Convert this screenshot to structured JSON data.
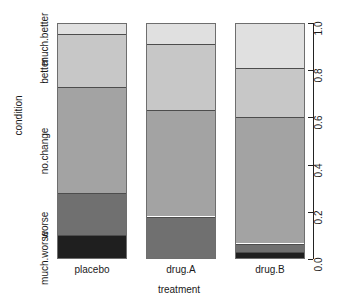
{
  "chart_data": {
    "type": "bar",
    "variant": "stacked-proportional-mosaic",
    "title": "",
    "xlabel": "treatment",
    "ylabel": "condition",
    "categories": [
      "placebo",
      "drug.A",
      "drug.B"
    ],
    "stack_levels": [
      "much.worse",
      "worse",
      "no.change",
      "better",
      "much.better"
    ],
    "right_axis": {
      "ticks": [
        "0.0",
        "0.2",
        "0.4",
        "0.6",
        "0.8",
        "1.0"
      ],
      "tick_values": [
        0.0,
        0.2,
        0.4,
        0.6,
        0.8,
        1.0
      ],
      "limits": [
        0.0,
        1.0
      ]
    },
    "grid": false,
    "legend": "none",
    "series": [
      {
        "name": "much.worse",
        "values": [
          0.1,
          0.0,
          0.03
        ],
        "color": "#1f1f1f"
      },
      {
        "name": "worse",
        "values": [
          0.18,
          0.18,
          0.035
        ],
        "color": "#707070"
      },
      {
        "name": "no.change",
        "values": [
          0.45,
          0.45,
          0.535
        ],
        "color": "#a3a3a3"
      },
      {
        "name": "better",
        "values": [
          0.225,
          0.28,
          0.21
        ],
        "color": "#c7c7c7"
      },
      {
        "name": "much.better",
        "values": [
          0.045,
          0.09,
          0.19
        ],
        "color": "#e0e0e0"
      }
    ],
    "columns": [
      {
        "category": "placebo",
        "segments": [
          {
            "level": "much.better",
            "value": 0.045,
            "color": "#e0e0e0"
          },
          {
            "level": "better",
            "value": 0.225,
            "color": "#c7c7c7"
          },
          {
            "level": "no.change",
            "value": 0.45,
            "color": "#a3a3a3"
          },
          {
            "level": "worse",
            "value": 0.18,
            "color": "#707070"
          },
          {
            "level": "much.worse",
            "value": 0.1,
            "color": "#1f1f1f"
          }
        ]
      },
      {
        "category": "drug.A",
        "segments": [
          {
            "level": "much.better",
            "value": 0.09,
            "color": "#e0e0e0"
          },
          {
            "level": "better",
            "value": 0.28,
            "color": "#c7c7c7"
          },
          {
            "level": "no.change",
            "value": 0.45,
            "color": "#a3a3a3"
          },
          {
            "level": "worse",
            "value": 0.18,
            "color": "#707070"
          },
          {
            "level": "much.worse",
            "value": 0.0,
            "color": "#1f1f1f"
          }
        ]
      },
      {
        "category": "drug.B",
        "segments": [
          {
            "level": "much.better",
            "value": 0.19,
            "color": "#e0e0e0"
          },
          {
            "level": "better",
            "value": 0.21,
            "color": "#c7c7c7"
          },
          {
            "level": "no.change",
            "value": 0.535,
            "color": "#a3a3a3"
          },
          {
            "level": "worse",
            "value": 0.035,
            "color": "#707070"
          },
          {
            "level": "much.worse",
            "value": 0.03,
            "color": "#1f1f1f"
          }
        ]
      }
    ]
  },
  "axes": {
    "left": {
      "title": "condition",
      "labels": [
        {
          "text": "much.better",
          "center_fraction": 0.9775
        },
        {
          "text": "better",
          "center_fraction": 0.8425
        },
        {
          "text": "no.change",
          "center_fraction": 0.505
        },
        {
          "text": "worse",
          "center_fraction": 0.19
        },
        {
          "text": "much.worse",
          "center_fraction": 0.05
        }
      ]
    },
    "right": {
      "ticks": [
        "0.0",
        "0.2",
        "0.4",
        "0.6",
        "0.8",
        "1.0"
      ]
    },
    "bottom": {
      "title": "treatment",
      "ticks": [
        "placebo",
        "drug.A",
        "drug.B"
      ]
    }
  },
  "colors": {
    "much_better": "#e0e0e0",
    "better": "#c7c7c7",
    "no_change": "#a3a3a3",
    "worse": "#707070",
    "much_worse": "#1f1f1f",
    "axis": "#222222",
    "text": "#1a1a1a",
    "background": "#ffffff",
    "segment_border": "#4d4d4d"
  }
}
